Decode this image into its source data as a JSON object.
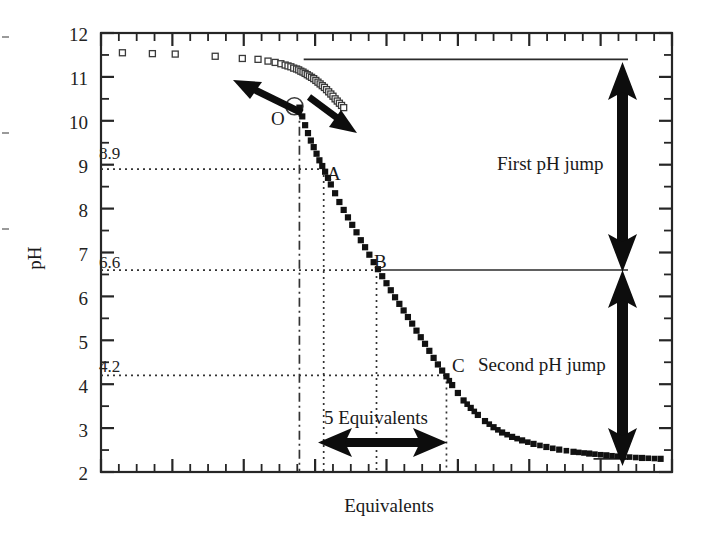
{
  "chart_data": {
    "type": "scatter",
    "title": "",
    "xlabel": "Equivalents",
    "ylabel": "pH",
    "xlim": [
      0,
      40
    ],
    "ylim": [
      2,
      12
    ],
    "grid": false,
    "legend": null,
    "y_ticks": [
      2,
      3,
      4,
      5,
      6,
      7,
      8,
      9,
      10,
      11,
      12
    ],
    "y_tick_labels": [
      "2",
      "3",
      "4",
      "5",
      "6",
      "7",
      "8",
      "9",
      "10",
      "11",
      "12"
    ],
    "y_minor_ticks": [
      2.5,
      3.5,
      4.5,
      5.5,
      6.5,
      7.5,
      8.5,
      9.5,
      10.5,
      11.5
    ],
    "x_ticks_unlabeled": true,
    "reference_levels": [
      {
        "label": "8.9",
        "value": 8.9,
        "style": "dotted"
      },
      {
        "label": "6.6",
        "value": 6.6,
        "style": "dotted"
      },
      {
        "label": "4.2",
        "value": 4.2,
        "style": "dotted"
      }
    ],
    "solid_levels": [
      {
        "value": 11.4,
        "style": "solid"
      },
      {
        "value": 6.6,
        "style": "solid"
      },
      {
        "value": 2.3,
        "style": "solid"
      }
    ],
    "marked_points": [
      {
        "label": "O",
        "x": 13.9,
        "y": 10.3,
        "marker": "open-square"
      },
      {
        "label": "A",
        "x": 15.6,
        "y": 8.9,
        "marker": "filled-square"
      },
      {
        "label": "B",
        "x": 19.3,
        "y": 6.6,
        "marker": "filled-square"
      },
      {
        "label": "C",
        "x": 24.2,
        "y": 4.2,
        "marker": "filled-square"
      }
    ],
    "series": [
      {
        "name": "reverse-branch-open-squares",
        "marker": "open-square",
        "x": [
          1.5,
          3.6,
          5.2,
          8.0,
          9.9,
          11.0,
          11.7,
          12.2,
          12.6,
          12.9,
          13.1,
          13.3,
          13.5,
          13.7,
          13.85,
          14.0,
          14.15,
          14.3,
          14.45,
          14.6,
          14.75,
          14.9,
          15.05,
          15.2,
          15.35,
          15.5,
          15.65,
          15.8,
          15.95,
          16.1,
          16.25,
          16.4,
          16.55,
          16.7,
          16.85,
          17.0
        ],
        "y": [
          11.55,
          11.53,
          11.52,
          11.47,
          11.42,
          11.4,
          11.36,
          11.33,
          11.3,
          11.27,
          11.25,
          11.23,
          11.2,
          11.18,
          11.16,
          11.13,
          11.11,
          11.08,
          11.05,
          11.02,
          10.99,
          10.96,
          10.92,
          10.88,
          10.84,
          10.8,
          10.76,
          10.71,
          10.66,
          10.61,
          10.56,
          10.5,
          10.45,
          10.4,
          10.35,
          10.3
        ]
      },
      {
        "name": "forward-branch-filled-squares",
        "marker": "filled-square",
        "x": [
          13.9,
          14.1,
          14.3,
          14.5,
          14.7,
          14.9,
          15.1,
          15.3,
          15.5,
          15.7,
          15.9,
          16.1,
          16.4,
          16.7,
          17.0,
          17.3,
          17.6,
          17.9,
          18.2,
          18.5,
          18.8,
          19.1,
          19.4,
          19.7,
          20.0,
          20.3,
          20.6,
          20.9,
          21.2,
          21.5,
          21.8,
          22.1,
          22.4,
          22.7,
          23.0,
          23.3,
          23.6,
          23.9,
          24.2,
          24.6,
          25.0,
          25.4,
          25.9,
          26.4,
          26.9,
          27.5,
          28.1,
          28.8,
          29.5,
          30.3,
          31.2,
          32.1,
          33.1,
          34.2,
          35.4,
          36.6,
          37.9,
          39.2
        ],
        "y": [
          10.3,
          10.1,
          9.9,
          9.72,
          9.55,
          9.4,
          9.25,
          9.1,
          8.97,
          8.84,
          8.7,
          8.55,
          8.35,
          8.15,
          7.97,
          7.8,
          7.63,
          7.46,
          7.28,
          7.12,
          6.95,
          6.78,
          6.62,
          6.46,
          6.3,
          6.14,
          5.98,
          5.83,
          5.68,
          5.53,
          5.38,
          5.22,
          5.07,
          4.92,
          4.76,
          4.6,
          4.45,
          4.31,
          4.18,
          3.98,
          3.8,
          3.63,
          3.46,
          3.3,
          3.16,
          3.02,
          2.9,
          2.8,
          2.72,
          2.64,
          2.57,
          2.51,
          2.46,
          2.42,
          2.38,
          2.35,
          2.32,
          2.3
        ]
      }
    ],
    "annotations": [
      {
        "name": "first-ph-jump",
        "text": "First pH jump",
        "from_y": 11.4,
        "to_y": 6.6,
        "arrow": "double-vertical"
      },
      {
        "name": "second-ph-jump",
        "text": "Second pH jump",
        "from_y": 6.6,
        "to_y": 2.3,
        "arrow": "double-vertical"
      },
      {
        "name": "five-equivalents",
        "text": "5 Equivalents",
        "from_x": 15.6,
        "to_x": 24.2,
        "arrow": "double-horizontal"
      },
      {
        "name": "reverse-direction-arrow",
        "text": "",
        "arrow": "up-left"
      },
      {
        "name": "forward-direction-arrow",
        "text": "",
        "arrow": "down-right"
      }
    ],
    "dropline_x_values": [
      13.9,
      15.6,
      19.3,
      24.2
    ]
  },
  "labels": {
    "y_axis_title": "pH",
    "x_axis_title": "Equivalents",
    "ref_8_9": "8.9",
    "ref_6_6": "6.6",
    "ref_4_2": "4.2",
    "point_o": "O",
    "point_a": "A",
    "point_b": "B",
    "point_c": "C",
    "first_jump": "First pH jump",
    "second_jump": "Second pH jump",
    "five_equivalents": "5 Equivalents",
    "tick_12": "12",
    "tick_11": "11",
    "tick_10": "10",
    "tick_9": "9",
    "tick_8": "8",
    "tick_7": "7",
    "tick_6": "6",
    "tick_5": "5",
    "tick_4": "4",
    "tick_3": "3",
    "tick_2": "2"
  },
  "colors": {
    "axis": "#262626",
    "marker_fill": "#111111",
    "marker_open": "#ffffff",
    "dotted": "#333333",
    "background": "#ffffff"
  }
}
